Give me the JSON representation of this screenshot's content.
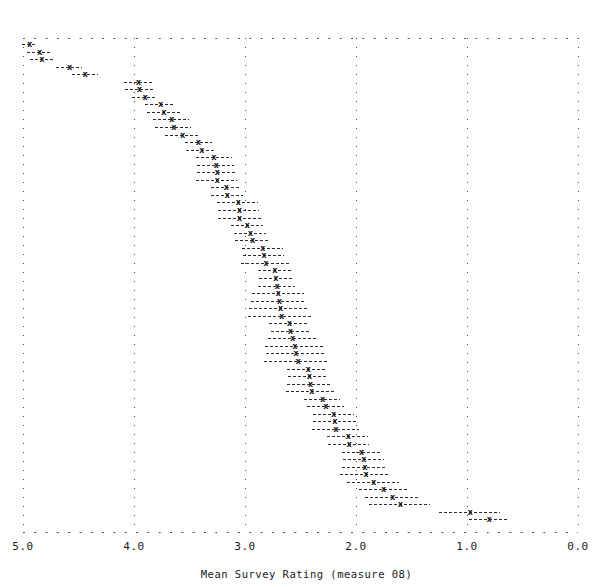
{
  "chart_data": {
    "type": "scatter",
    "title": "",
    "subtitle": "",
    "xlabel": "Mean Survey Rating (measure 08)",
    "ylabel": "",
    "xlim": [
      5.0,
      0.0
    ],
    "x_reversed": true,
    "xticks": [
      5.0,
      4.0,
      3.0,
      2.0,
      1.0,
      0.0
    ],
    "xticklabels": [
      "5.0",
      "4.0",
      "3.0",
      "2.0",
      "1.0",
      "0.0"
    ],
    "grid": "dotted-vertical-and-border",
    "legend": "none",
    "marker_symbol": "x",
    "errorbar_style": "dashed horizontal confidence interval",
    "n_items": 64,
    "series": [
      {
        "name": "Mean Survey Rating with confidence interval",
        "points": [
          {
            "rank": 1,
            "value": 4.94,
            "low": 5.01,
            "high": 4.87
          },
          {
            "rank": 2,
            "value": 4.85,
            "low": 4.96,
            "high": 4.74
          },
          {
            "rank": 3,
            "value": 4.83,
            "low": 4.94,
            "high": 4.73
          },
          {
            "rank": 4,
            "value": 4.58,
            "low": 4.7,
            "high": 4.47
          },
          {
            "rank": 5,
            "value": 4.44,
            "low": 4.56,
            "high": 4.32
          },
          {
            "rank": 6,
            "value": 3.96,
            "low": 4.09,
            "high": 3.84
          },
          {
            "rank": 7,
            "value": 3.95,
            "low": 4.08,
            "high": 3.83
          },
          {
            "rank": 8,
            "value": 3.9,
            "low": 4.02,
            "high": 3.79
          },
          {
            "rank": 9,
            "value": 3.76,
            "low": 3.9,
            "high": 3.63
          },
          {
            "rank": 10,
            "value": 3.73,
            "low": 3.88,
            "high": 3.59
          },
          {
            "rank": 11,
            "value": 3.66,
            "low": 3.83,
            "high": 3.5
          },
          {
            "rank": 12,
            "value": 3.64,
            "low": 3.81,
            "high": 3.49
          },
          {
            "rank": 13,
            "value": 3.56,
            "low": 3.72,
            "high": 3.41
          },
          {
            "rank": 14,
            "value": 3.42,
            "low": 3.54,
            "high": 3.3
          },
          {
            "rank": 15,
            "value": 3.39,
            "low": 3.53,
            "high": 3.26
          },
          {
            "rank": 16,
            "value": 3.28,
            "low": 3.44,
            "high": 3.12
          },
          {
            "rank": 17,
            "value": 3.26,
            "low": 3.43,
            "high": 3.1
          },
          {
            "rank": 18,
            "value": 3.25,
            "low": 3.43,
            "high": 3.08
          },
          {
            "rank": 19,
            "value": 3.25,
            "low": 3.44,
            "high": 3.07
          },
          {
            "rank": 20,
            "value": 3.17,
            "low": 3.31,
            "high": 3.04
          },
          {
            "rank": 21,
            "value": 3.16,
            "low": 3.31,
            "high": 3.02
          },
          {
            "rank": 22,
            "value": 3.06,
            "low": 3.25,
            "high": 2.88
          },
          {
            "rank": 23,
            "value": 3.05,
            "low": 3.24,
            "high": 2.87
          },
          {
            "rank": 24,
            "value": 3.05,
            "low": 3.24,
            "high": 2.86
          },
          {
            "rank": 25,
            "value": 2.98,
            "low": 3.13,
            "high": 2.84
          },
          {
            "rank": 26,
            "value": 2.95,
            "low": 3.1,
            "high": 2.81
          },
          {
            "rank": 27,
            "value": 2.93,
            "low": 3.09,
            "high": 2.78
          },
          {
            "rank": 28,
            "value": 2.84,
            "low": 3.03,
            "high": 2.66
          },
          {
            "rank": 29,
            "value": 2.83,
            "low": 3.02,
            "high": 2.65
          },
          {
            "rank": 30,
            "value": 2.81,
            "low": 3.04,
            "high": 2.59
          },
          {
            "rank": 31,
            "value": 2.73,
            "low": 2.88,
            "high": 2.59
          },
          {
            "rank": 32,
            "value": 2.72,
            "low": 2.87,
            "high": 2.58
          },
          {
            "rank": 33,
            "value": 2.71,
            "low": 2.88,
            "high": 2.55
          },
          {
            "rank": 34,
            "value": 2.7,
            "low": 2.94,
            "high": 2.47
          },
          {
            "rank": 35,
            "value": 2.69,
            "low": 2.95,
            "high": 2.45
          },
          {
            "rank": 36,
            "value": 2.68,
            "low": 2.96,
            "high": 2.42
          },
          {
            "rank": 37,
            "value": 2.67,
            "low": 2.97,
            "high": 2.4
          },
          {
            "rank": 38,
            "value": 2.6,
            "low": 2.78,
            "high": 2.43
          },
          {
            "rank": 39,
            "value": 2.59,
            "low": 2.77,
            "high": 2.42
          },
          {
            "rank": 40,
            "value": 2.57,
            "low": 2.79,
            "high": 2.36
          },
          {
            "rank": 41,
            "value": 2.55,
            "low": 2.82,
            "high": 2.3
          },
          {
            "rank": 42,
            "value": 2.54,
            "low": 2.81,
            "high": 2.29
          },
          {
            "rank": 43,
            "value": 2.52,
            "low": 2.83,
            "high": 2.25
          },
          {
            "rank": 44,
            "value": 2.43,
            "low": 2.62,
            "high": 2.26
          },
          {
            "rank": 45,
            "value": 2.42,
            "low": 2.61,
            "high": 2.25
          },
          {
            "rank": 46,
            "value": 2.41,
            "low": 2.62,
            "high": 2.22
          },
          {
            "rank": 47,
            "value": 2.4,
            "low": 2.63,
            "high": 2.2
          },
          {
            "rank": 48,
            "value": 2.3,
            "low": 2.47,
            "high": 2.14
          },
          {
            "rank": 49,
            "value": 2.27,
            "low": 2.44,
            "high": 2.11
          },
          {
            "rank": 50,
            "value": 2.2,
            "low": 2.39,
            "high": 2.02
          },
          {
            "rank": 51,
            "value": 2.19,
            "low": 2.39,
            "high": 2.0
          },
          {
            "rank": 52,
            "value": 2.18,
            "low": 2.4,
            "high": 1.97
          },
          {
            "rank": 53,
            "value": 2.07,
            "low": 2.26,
            "high": 1.89
          },
          {
            "rank": 54,
            "value": 2.06,
            "low": 2.25,
            "high": 1.88
          },
          {
            "rank": 55,
            "value": 1.95,
            "low": 2.13,
            "high": 1.77
          },
          {
            "rank": 56,
            "value": 1.93,
            "low": 2.12,
            "high": 1.75
          },
          {
            "rank": 57,
            "value": 1.92,
            "low": 2.13,
            "high": 1.72
          },
          {
            "rank": 58,
            "value": 1.91,
            "low": 2.14,
            "high": 1.7
          },
          {
            "rank": 59,
            "value": 1.84,
            "low": 2.08,
            "high": 1.61
          },
          {
            "rank": 60,
            "value": 1.75,
            "low": 1.97,
            "high": 1.54
          },
          {
            "rank": 61,
            "value": 1.67,
            "low": 1.92,
            "high": 1.43
          },
          {
            "rank": 62,
            "value": 1.6,
            "low": 1.88,
            "high": 1.33
          },
          {
            "rank": 63,
            "value": 0.97,
            "low": 1.25,
            "high": 0.7
          },
          {
            "rank": 64,
            "value": 0.8,
            "low": 0.98,
            "high": 0.62
          }
        ]
      }
    ]
  },
  "axis": {
    "x_title": "Mean Survey Rating (measure 08)",
    "tick_labels": [
      "5.0",
      "4.0",
      "3.0",
      "2.0",
      "1.0",
      "0.0"
    ]
  },
  "style": {
    "marker_glyph": "x",
    "ink_color": "#1a1a1a",
    "grid_color": "#4a4a4a",
    "background": "#ffffff"
  }
}
